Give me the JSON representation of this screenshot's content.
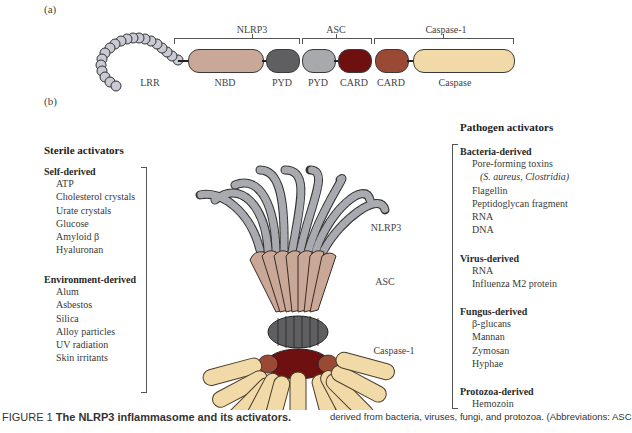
{
  "panel_a": {
    "label": "(a)",
    "groups": {
      "nlrp3": "NLRP3",
      "asc": "ASC",
      "caspase1": "Caspase-1"
    },
    "domains": [
      {
        "name": "LRR",
        "color": "#c9cad3"
      },
      {
        "name": "NBD",
        "color": "#c9a898"
      },
      {
        "name": "PYD",
        "color": "#5f5f62"
      },
      {
        "name": "PYD",
        "color": "#a7a9ac"
      },
      {
        "name": "CARD",
        "color": "#6e1010"
      },
      {
        "name": "CARD",
        "color": "#9a4a34"
      },
      {
        "name": "Caspase",
        "color": "#f1d9a8"
      }
    ]
  },
  "panel_b": {
    "label": "(b)",
    "complex_labels": {
      "nlrp3": "NLRP3",
      "asc": "ASC",
      "caspase1": "Caspase-1"
    },
    "sterile": {
      "title": "Sterile activators",
      "groups": [
        {
          "name": "Self-derived",
          "items": [
            "ATP",
            "Cholesterol crystals",
            "Urate crystals",
            "Glucose",
            "Amyloid β",
            "Hyaluronan"
          ]
        },
        {
          "name": "Environment-derived",
          "items": [
            "Alum",
            "Asbestos",
            "Silica",
            "Alloy particles",
            "UV radiation",
            "Skin irritants"
          ]
        }
      ]
    },
    "pathogen": {
      "title": "Pathogen activators",
      "groups": [
        {
          "name": "Bacteria-derived",
          "items": [
            "Pore-forming toxins",
            "(S. aureus, Clostridia)",
            "Flagellin",
            "Peptidoglycan fragment",
            "RNA",
            "DNA"
          ]
        },
        {
          "name": "Virus-derived",
          "items": [
            "RNA",
            "Influenza M2 protein"
          ]
        },
        {
          "name": "Fungus-derived",
          "items": [
            "β-glucans",
            "Mannan",
            "Zymosan",
            "Hyphae"
          ]
        },
        {
          "name": "Protozoa-derived",
          "items": [
            "Hemozoin"
          ]
        }
      ]
    }
  },
  "caption": {
    "prefix": "FIGURE 1 ",
    "title": "The NLRP3 inflammasome and its activators.",
    "continuation": "derived from bacteria, viruses, fungi, and protozoa. (Abbreviations: ASC"
  }
}
